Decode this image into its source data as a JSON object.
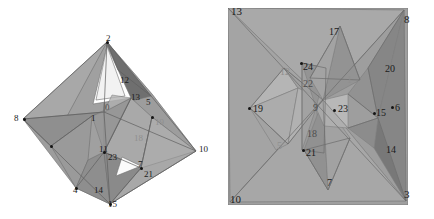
{
  "figure_left": {
    "name": "octahedron-complex-left",
    "x": 0,
    "y": 0,
    "width": 217,
    "height": 219,
    "background": "#ffffff",
    "palette": {
      "face_light": "#b9b9b9",
      "face_mid": "#a2a2a2",
      "face_dark": "#8a8a8a",
      "face_darker": "#6f6f6f",
      "face_darkest": "#555555",
      "edge": "#6a6a6a"
    },
    "outline_vertices": [
      {
        "label": "2",
        "x": 107,
        "y": 42
      },
      {
        "label": "10",
        "x": 196,
        "y": 151
      },
      {
        "label": "15",
        "x": 110,
        "y": 204
      },
      {
        "label": "8",
        "x": 23,
        "y": 119
      }
    ],
    "labels": [
      {
        "text": "2",
        "x": 106,
        "y": 34,
        "tone": "dark",
        "size": 9
      },
      {
        "text": "12",
        "x": 120,
        "y": 76,
        "tone": "dark",
        "size": 9
      },
      {
        "text": "13",
        "x": 131,
        "y": 93,
        "tone": "dark",
        "size": 9
      },
      {
        "text": "5",
        "x": 146,
        "y": 98,
        "tone": "dark",
        "size": 9
      },
      {
        "text": "0",
        "x": 105,
        "y": 103,
        "tone": "mid",
        "size": 9
      },
      {
        "text": "1",
        "x": 91,
        "y": 114,
        "tone": "dark",
        "size": 9
      },
      {
        "text": "8",
        "x": 14,
        "y": 114,
        "tone": "dark",
        "size": 9
      },
      {
        "text": "19",
        "x": 155,
        "y": 118,
        "tone": "light",
        "size": 9
      },
      {
        "text": "18",
        "x": 134,
        "y": 134,
        "tone": "light",
        "size": 9
      },
      {
        "text": "10",
        "x": 199,
        "y": 145,
        "tone": "dark",
        "size": 9
      },
      {
        "text": "11",
        "x": 99,
        "y": 145,
        "tone": "dark",
        "size": 9
      },
      {
        "text": "23",
        "x": 108,
        "y": 153,
        "tone": "dark",
        "size": 9
      },
      {
        "text": "7",
        "x": 138,
        "y": 160,
        "tone": "dark",
        "size": 9
      },
      {
        "text": "21",
        "x": 144,
        "y": 170,
        "tone": "dark",
        "size": 9
      },
      {
        "text": "4",
        "x": 73,
        "y": 186,
        "tone": "dark",
        "size": 9
      },
      {
        "text": "14",
        "x": 94,
        "y": 186,
        "tone": "dark",
        "size": 9
      },
      {
        "text": "15",
        "x": 108,
        "y": 200,
        "tone": "dark",
        "size": 9
      }
    ],
    "dots": [
      {
        "x": 107,
        "y": 42
      },
      {
        "x": 24,
        "y": 119
      },
      {
        "x": 51,
        "y": 146
      },
      {
        "x": 104,
        "y": 152
      },
      {
        "x": 76,
        "y": 188
      },
      {
        "x": 110,
        "y": 204
      },
      {
        "x": 141,
        "y": 168
      },
      {
        "x": 152,
        "y": 117
      }
    ]
  },
  "figure_right": {
    "name": "stellated-polyhedron-right",
    "x": 228,
    "y": 8,
    "width": 180,
    "height": 197,
    "background": "#ffffff",
    "palette": {
      "face_light": "#b0b0b0",
      "face_mid": "#9a9a9a",
      "face_dark": "#848484",
      "face_darker": "#6c6c6c",
      "face_darkest": "#585858",
      "edge": "#6a6a6a"
    },
    "corner_labels": [
      {
        "text": "13",
        "x": 231,
        "y": 6,
        "tone": "dark",
        "size": 11
      },
      {
        "text": "8",
        "x": 404,
        "y": 14,
        "tone": "dark",
        "size": 11
      },
      {
        "text": "10",
        "x": 230,
        "y": 194,
        "tone": "dark",
        "size": 11
      },
      {
        "text": "3",
        "x": 404,
        "y": 189,
        "tone": "dark",
        "size": 11
      }
    ],
    "labels": [
      {
        "text": "17",
        "x": 329,
        "y": 27,
        "tone": "dark",
        "size": 10
      },
      {
        "text": "24",
        "x": 303,
        "y": 62,
        "tone": "dark",
        "size": 10
      },
      {
        "text": "20",
        "x": 385,
        "y": 64,
        "tone": "dark",
        "size": 10
      },
      {
        "text": "12",
        "x": 280,
        "y": 67,
        "tone": "light",
        "size": 10
      },
      {
        "text": "22",
        "x": 303,
        "y": 79,
        "tone": "mid",
        "size": 10
      },
      {
        "text": "1",
        "x": 347,
        "y": 75,
        "tone": "light",
        "size": 10
      },
      {
        "text": "19",
        "x": 253,
        "y": 104,
        "tone": "dark",
        "size": 10
      },
      {
        "text": "9",
        "x": 313,
        "y": 103,
        "tone": "mid",
        "size": 10
      },
      {
        "text": "23",
        "x": 338,
        "y": 104,
        "tone": "dark",
        "size": 10
      },
      {
        "text": "15",
        "x": 376,
        "y": 108,
        "tone": "dark",
        "size": 10
      },
      {
        "text": "6",
        "x": 395,
        "y": 103,
        "tone": "dark",
        "size": 10
      },
      {
        "text": "18",
        "x": 307,
        "y": 129,
        "tone": "mid",
        "size": 10
      },
      {
        "text": "5",
        "x": 277,
        "y": 141,
        "tone": "light",
        "size": 10
      },
      {
        "text": "14",
        "x": 386,
        "y": 145,
        "tone": "dark",
        "size": 10
      },
      {
        "text": "21",
        "x": 306,
        "y": 148,
        "tone": "dark",
        "size": 10
      },
      {
        "text": "7",
        "x": 327,
        "y": 178,
        "tone": "dark",
        "size": 10
      }
    ],
    "dots": [
      {
        "x": 249,
        "y": 108
      },
      {
        "x": 301,
        "y": 63
      },
      {
        "x": 334,
        "y": 110
      },
      {
        "x": 303,
        "y": 150
      },
      {
        "x": 392,
        "y": 107
      },
      {
        "x": 374,
        "y": 113
      }
    ]
  },
  "diagram": {
    "type": "polyhedron-pair",
    "caption": "",
    "panel_count": 2
  }
}
